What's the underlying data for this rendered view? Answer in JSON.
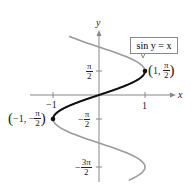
{
  "figure": {
    "equation_label": "sin y = x",
    "axis_x_label": "x",
    "axis_y_label": "y",
    "x_ticks": [
      {
        "label": "−1",
        "value": -1
      },
      {
        "label": "1",
        "value": 1
      }
    ],
    "y_ticks": [
      {
        "num": "π",
        "den": "2",
        "sign": "",
        "value": "π/2"
      },
      {
        "num": "π",
        "den": "2",
        "sign": "−",
        "value": "−π/2"
      },
      {
        "num": "3π",
        "den": "2",
        "sign": "−",
        "value": "−3π/2"
      }
    ],
    "points": [
      {
        "x_label": "1",
        "y_num": "π",
        "y_den": "2",
        "y_sign": ""
      },
      {
        "x_label": "−1",
        "y_num": "π",
        "y_den": "2",
        "y_sign": "−"
      }
    ],
    "colors": {
      "full_curve": "#9a9a9a",
      "principal_branch": "#111111",
      "axes": "#888888"
    }
  }
}
